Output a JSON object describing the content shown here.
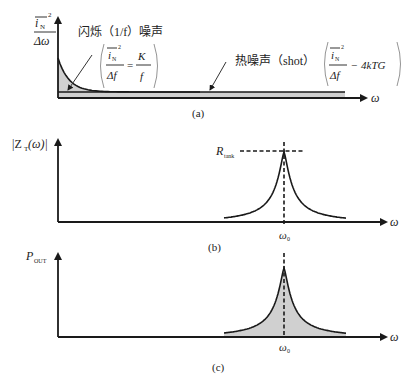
{
  "chart_data": [
    {
      "type": "area",
      "panel_label": "(a)",
      "ylabel": {
        "numerator": "i",
        "numerator_sub": "N",
        "numerator_sup": "2",
        "denominator": "Δω"
      },
      "xlabel": "ω",
      "annotations": [
        {
          "text": "闪烁（1/f）噪声",
          "formula": {
            "lhs_num": "i",
            "lhs_sub": "N",
            "lhs_sup": "2",
            "lhs_den": "Δf",
            "eq": "=",
            "rhs_num": "K",
            "rhs_den": "f"
          }
        },
        {
          "text": "热噪声（shot）",
          "formula": {
            "lhs_num": "i",
            "lhs_sub": "N",
            "lhs_sup": "2",
            "lhs_den": "Δf",
            "eq": "−",
            "rhs": "4kTG"
          }
        }
      ],
      "series": [
        {
          "name": "flicker noise",
          "shape": "1/f decay",
          "filled": true
        },
        {
          "name": "thermal noise",
          "shape": "flat floor",
          "filled": true
        }
      ]
    },
    {
      "type": "line",
      "panel_label": "(b)",
      "ylabel": {
        "base": "|Z",
        "sub": "T",
        "suffix": "(ω)|"
      },
      "xlabel": "ω",
      "center_label": {
        "base": "ω",
        "sub": "0"
      },
      "peak_label": {
        "base": "R",
        "sub": "tank"
      },
      "series": [
        {
          "name": "tank impedance",
          "shape": "resonant peak at ω0",
          "peak_relative": 1.0,
          "filled": false
        }
      ]
    },
    {
      "type": "area",
      "panel_label": "(c)",
      "ylabel": {
        "base": "P",
        "sub": "OUT"
      },
      "xlabel": "ω",
      "center_label": {
        "base": "ω",
        "sub": "0"
      },
      "series": [
        {
          "name": "output power spectrum",
          "shape": "resonant peak at ω0",
          "peak_relative": 1.0,
          "filled": true
        }
      ]
    }
  ],
  "colors": {
    "ink": "#1a1a1a",
    "fill": "#d0d0d0",
    "text": "#222222"
  }
}
